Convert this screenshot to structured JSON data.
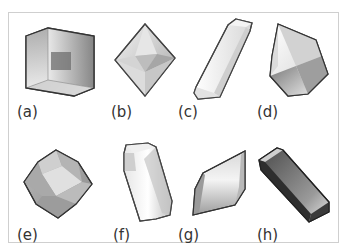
{
  "figure": {
    "panels": [
      {
        "id": "a",
        "label": "(a)",
        "shape": "cube"
      },
      {
        "id": "b",
        "label": "(b)",
        "shape": "octahedron"
      },
      {
        "id": "c",
        "label": "(c)",
        "shape": "elongated-prism"
      },
      {
        "id": "d",
        "label": "(d)",
        "shape": "pyramidal-crystal"
      },
      {
        "id": "e",
        "label": "(e)",
        "shape": "rhombic-dodecahedron"
      },
      {
        "id": "f",
        "label": "(f)",
        "shape": "columnar-prism"
      },
      {
        "id": "g",
        "label": "(g)",
        "shape": "rhombohedron"
      },
      {
        "id": "h",
        "label": "(h)",
        "shape": "dark-rectangular-block"
      }
    ]
  }
}
